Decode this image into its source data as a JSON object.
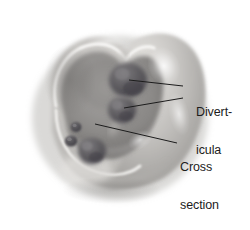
{
  "figure": {
    "kind": "medical-illustration",
    "frame_color": "#a9a9a9",
    "background_color": "#ffffff",
    "palette": {
      "tissue_light": "#d8d6d3",
      "tissue_mid": "#b3b1ae",
      "tissue_shadow": "#8e8c89",
      "lumen_dark": "#6f6d6b",
      "pouch_dark": "#58565a",
      "highlight": "#f2f1ef",
      "cut_edge": "#f6f5f3",
      "text_color": "#1c1c1c",
      "leader_line_color": "#1c1c1c"
    }
  },
  "labels": {
    "diverticula": {
      "name": "Diverticula",
      "lines": [
        "Divert-",
        "icula"
      ]
    },
    "cross_section": {
      "name": "Cross section of colon",
      "lines": [
        "Cross",
        "section",
        "of colon"
      ]
    }
  },
  "leader_lines": [
    {
      "id": "leader-diverticula-upper",
      "from_label": "diverticula",
      "points_to": "upper-diverticulum-pouch",
      "x1": 183,
      "y1": 86,
      "x2": 129,
      "y2": 80
    },
    {
      "id": "leader-diverticula-lower",
      "from_label": "diverticula",
      "points_to": "middle-diverticulum-pouch",
      "x1": 183,
      "y1": 98,
      "x2": 124,
      "y2": 108
    },
    {
      "id": "leader-cross-section",
      "from_label": "cross_section",
      "points_to": "cut-colon-wall-edge",
      "x1": 177,
      "y1": 143,
      "x2": 95,
      "y2": 124
    }
  ],
  "anatomy": {
    "parts": [
      {
        "name": "colon-outer-wall",
        "note": "bulbous outer surface of large intestine"
      },
      {
        "name": "colon-lumen",
        "note": "open interior cavity exposed by the cut"
      },
      {
        "name": "cut-colon-wall-edge",
        "note": "bright sliced edge of the bowel wall"
      },
      {
        "name": "diverticulum-opening-small-upper",
        "note": "small dark ostium inside lumen"
      },
      {
        "name": "diverticulum-opening-small-lower",
        "note": "small dark ostium inside lumen"
      },
      {
        "name": "upper-diverticulum-pouch",
        "note": "large dark out-pouching, upper right"
      },
      {
        "name": "middle-diverticulum-pouch",
        "note": "dark out-pouching, middle right"
      },
      {
        "name": "lower-diverticulum-pouch",
        "note": "dark out-pouching, bottom center"
      }
    ]
  }
}
